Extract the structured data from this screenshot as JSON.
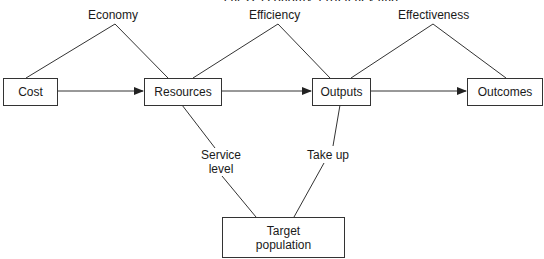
{
  "diagram": {
    "title_fragment": "…eness, economy, efficiency and effectiveness…",
    "nodes": {
      "cost": "Cost",
      "resources": "Resources",
      "outputs": "Outputs",
      "outcomes": "Outcomes",
      "target_population": "Target population"
    },
    "relations": {
      "economy": "Economy",
      "efficiency": "Efficiency",
      "effectiveness": "Effectiveness",
      "service_level": "Service level",
      "take_up": "Take up"
    },
    "edges": [
      {
        "from": "Cost",
        "to": "Resources",
        "type": "arrow"
      },
      {
        "from": "Resources",
        "to": "Outputs",
        "type": "arrow"
      },
      {
        "from": "Outputs",
        "to": "Outcomes",
        "type": "arrow"
      },
      {
        "from": "Cost",
        "to": "Resources",
        "via": "Economy",
        "type": "line"
      },
      {
        "from": "Resources",
        "to": "Outputs",
        "via": "Efficiency",
        "type": "line"
      },
      {
        "from": "Outputs",
        "to": "Outcomes",
        "via": "Effectiveness",
        "type": "line"
      },
      {
        "from": "Resources",
        "to": "Target population",
        "via": "Service level",
        "type": "line"
      },
      {
        "from": "Outputs",
        "to": "Target population",
        "via": "Take up",
        "type": "line"
      }
    ],
    "colors": {
      "line": "#333333",
      "background": "#ffffff",
      "text": "#1a1a1a"
    }
  }
}
